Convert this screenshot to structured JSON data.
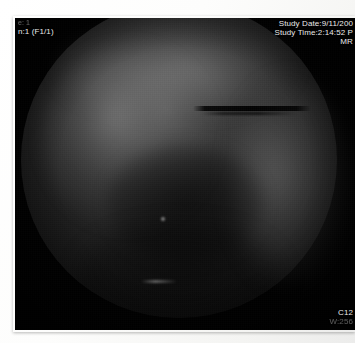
{
  "viewer": {
    "modality_label": "MR",
    "image_frame_name": "fluoroscopy-image"
  },
  "overlay": {
    "top_left": {
      "line1": "e: 1",
      "line2": "n:1 (F1/1)"
    },
    "top_right": {
      "study_date": "Study Date:9/11/200",
      "study_time": "Study Time:2:14:52 P",
      "modality": "MR"
    },
    "bottom_right": {
      "line1": "C12",
      "line2": "W:256"
    }
  },
  "chart_data": {
    "type": "heatmap",
    "xlabel": "",
    "ylabel": ""
  }
}
